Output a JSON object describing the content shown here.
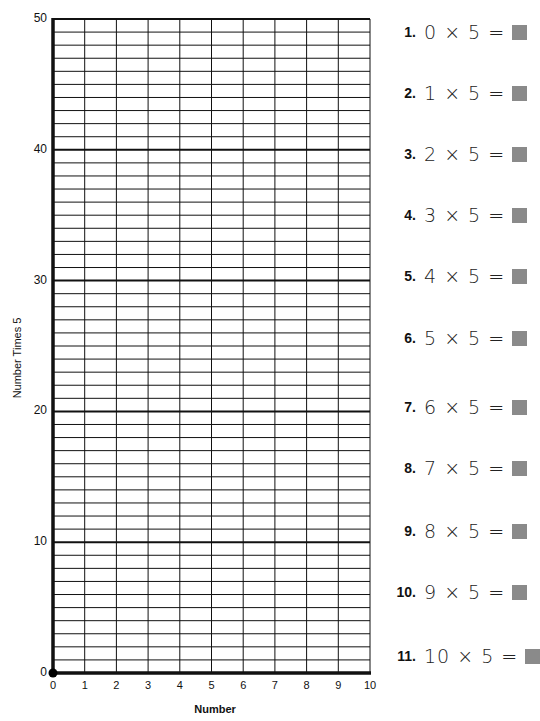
{
  "chart_data": {
    "type": "line",
    "title": "",
    "xlabel": "Number",
    "ylabel": "Number Times 5",
    "xlim": [
      0,
      10
    ],
    "ylim": [
      0,
      50
    ],
    "x_ticks": [
      "0",
      "1",
      "2",
      "3",
      "4",
      "5",
      "6",
      "7",
      "8",
      "9",
      "10"
    ],
    "y_ticks": [
      "0",
      "10",
      "20",
      "30",
      "40",
      "50"
    ],
    "grid": {
      "on": true,
      "x_minor_step": 1,
      "y_minor_step": 1,
      "y_major_step": 10
    },
    "plotted_points": [
      {
        "x": 0,
        "y": 0
      }
    ],
    "legend": null
  },
  "colors": {
    "grid_line": "#111111",
    "answer_box": "#8a8a8a",
    "text": "#111111",
    "background": "#ffffff"
  },
  "axes": {
    "x_title": "Number",
    "y_title": "Number Times 5",
    "x_labels": [
      "0",
      "1",
      "2",
      "3",
      "4",
      "5",
      "6",
      "7",
      "8",
      "9",
      "10"
    ],
    "y_labels": [
      "0",
      "10",
      "20",
      "30",
      "40",
      "50"
    ]
  },
  "problems": [
    {
      "number": "1.",
      "expression": "0 × 5 =",
      "answer": ""
    },
    {
      "number": "2.",
      "expression": "1 × 5 =",
      "answer": ""
    },
    {
      "number": "3.",
      "expression": "2 × 5 =",
      "answer": ""
    },
    {
      "number": "4.",
      "expression": "3 × 5 =",
      "answer": ""
    },
    {
      "number": "5.",
      "expression": "4 × 5 =",
      "answer": ""
    },
    {
      "number": "6.",
      "expression": "5 × 5 =",
      "answer": ""
    },
    {
      "number": "7.",
      "expression": "6 × 5 =",
      "answer": ""
    },
    {
      "number": "8.",
      "expression": "7 × 5 =",
      "answer": ""
    },
    {
      "number": "9.",
      "expression": "8 × 5 =",
      "answer": ""
    },
    {
      "number": "10.",
      "expression": "9 × 5 =",
      "answer": ""
    },
    {
      "number": "11.",
      "expression": "10 × 5 =",
      "answer": ""
    }
  ]
}
